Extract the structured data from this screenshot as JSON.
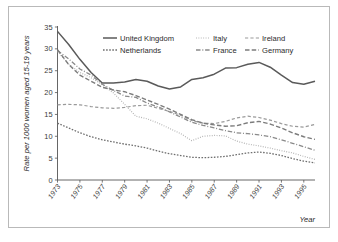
{
  "chart_data": {
    "type": "line",
    "title": "",
    "xlabel": "Year",
    "ylabel": "Rate per 1000 women aged 15-19 years",
    "xlim": [
      1973,
      1996
    ],
    "ylim": [
      0,
      35
    ],
    "ytick_values": [
      0,
      5,
      10,
      15,
      20,
      25,
      30,
      35
    ],
    "ytick_labels": [
      "0",
      "5",
      "10",
      "15",
      "20",
      "25",
      "30",
      "35"
    ],
    "xtick_values": [
      1973,
      1975,
      1977,
      1979,
      1981,
      1983,
      1985,
      1987,
      1989,
      1991,
      1993,
      1995
    ],
    "xtick_labels": [
      "1973",
      "1975",
      "1977",
      "1979",
      "1981",
      "1983",
      "1985",
      "1987",
      "1989",
      "1991",
      "1993",
      "1995"
    ],
    "grid": false,
    "legend_position": "top-center",
    "x": [
      1973,
      1974,
      1975,
      1976,
      1977,
      1978,
      1979,
      1980,
      1981,
      1982,
      1983,
      1984,
      1985,
      1986,
      1987,
      1988,
      1989,
      1990,
      1991,
      1992,
      1993,
      1994,
      1995,
      1996
    ],
    "series": [
      {
        "name": "United Kingdom",
        "dash": "solid",
        "color": "#5a5a5a",
        "width": 1.5,
        "values": [
          34.0,
          31.0,
          27.6,
          24.6,
          22.2,
          22.2,
          22.4,
          23.0,
          22.6,
          21.5,
          20.8,
          21.3,
          23.0,
          23.4,
          24.2,
          25.6,
          25.7,
          26.5,
          26.9,
          25.8,
          24.0,
          22.3,
          21.9,
          22.6
        ]
      },
      {
        "name": "Netherlands",
        "dash": "dotted",
        "color": "#6e6e6e",
        "width": 1.3,
        "values": [
          13.0,
          11.9,
          10.8,
          9.9,
          9.2,
          8.7,
          8.2,
          7.8,
          7.3,
          6.6,
          6.0,
          5.6,
          5.2,
          5.1,
          5.2,
          5.4,
          5.8,
          6.2,
          6.4,
          6.1,
          5.6,
          4.9,
          4.3,
          3.9
        ]
      },
      {
        "name": "Italy",
        "dash": "fine-dotted",
        "color": "#b0b0b0",
        "width": 1.2,
        "values": [
          29.4,
          26.5,
          24.6,
          23.4,
          21.8,
          19.9,
          17.3,
          14.6,
          14.0,
          13.0,
          11.8,
          10.6,
          9.0,
          10.0,
          10.2,
          10.1,
          8.9,
          8.2,
          7.8,
          7.3,
          6.7,
          6.2,
          5.4,
          4.7
        ]
      },
      {
        "name": "France",
        "dash": "dash-dot",
        "color": "#8a8a8a",
        "width": 1.3,
        "values": [
          29.6,
          27.7,
          25.4,
          24.0,
          21.9,
          20.5,
          19.2,
          18.9,
          17.6,
          16.7,
          15.6,
          14.4,
          13.2,
          12.5,
          11.9,
          11.3,
          10.8,
          10.6,
          10.3,
          9.9,
          9.2,
          8.4,
          7.6,
          6.8
        ]
      },
      {
        "name": "Ireland",
        "dash": "light-dash",
        "color": "#9a9a9a",
        "width": 1.2,
        "values": [
          17.2,
          17.3,
          17.2,
          16.8,
          16.5,
          16.4,
          16.6,
          17.0,
          17.1,
          16.4,
          15.7,
          14.8,
          13.6,
          13.0,
          12.9,
          13.4,
          14.2,
          14.6,
          14.3,
          13.7,
          12.9,
          12.3,
          12.1,
          12.7
        ]
      },
      {
        "name": "Germany",
        "dash": "dash",
        "color": "#7c7c7c",
        "width": 1.4,
        "values": [
          29.8,
          26.4,
          24.0,
          22.6,
          21.2,
          20.6,
          20.2,
          19.3,
          18.3,
          17.3,
          16.2,
          15.0,
          13.8,
          13.0,
          12.6,
          12.3,
          12.4,
          13.1,
          13.4,
          12.8,
          11.9,
          10.8,
          9.9,
          9.3
        ]
      }
    ]
  },
  "legend": {
    "entries": [
      {
        "label": "United Kingdom"
      },
      {
        "label": "Italy"
      },
      {
        "label": "Ireland"
      },
      {
        "label": "Netherlands"
      },
      {
        "label": "France"
      },
      {
        "label": "Germany"
      }
    ]
  }
}
